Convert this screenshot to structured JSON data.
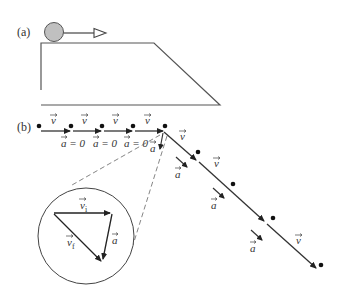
{
  "panel_a": {
    "label": "(a)"
  },
  "panel_b": {
    "label": "(b)",
    "horizontal_segments": [
      {
        "velocity_label": "v",
        "accel_label": "a = 0"
      },
      {
        "velocity_label": "v",
        "accel_label": "a = 0"
      },
      {
        "velocity_label": "v",
        "accel_label": "a = 0"
      },
      {
        "velocity_label": "v",
        "accel_label": "a"
      }
    ],
    "slope_segments": [
      {
        "velocity_label": "v",
        "accel_label": "a"
      },
      {
        "velocity_label": "v",
        "accel_label": "a"
      },
      {
        "velocity_label": "v",
        "accel_label": "a"
      }
    ],
    "inset": {
      "vi_label": "v",
      "vi_sub": "i",
      "vf_label": "v",
      "vf_sub": "f",
      "a_label": "a"
    }
  },
  "colors": {
    "ball_fill": "#c0c0c0",
    "line": "#333333",
    "dashed": "#666666"
  }
}
